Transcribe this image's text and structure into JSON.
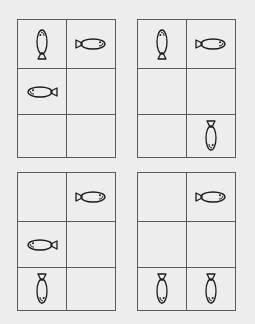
{
  "colors": {
    "background": "#ededed",
    "line": "#5a5a5a",
    "fish": "#1a1a1a"
  },
  "grid_size": {
    "rows": 3,
    "cols": 2
  },
  "panels": [
    {
      "name": "panel-top-left",
      "pos": [
        17,
        19
      ],
      "cells": [
        [
          "up",
          "right"
        ],
        [
          "left",
          ""
        ],
        [
          "",
          ""
        ]
      ]
    },
    {
      "name": "panel-top-right",
      "pos": [
        137,
        19
      ],
      "cells": [
        [
          "up",
          "right"
        ],
        [
          "",
          ""
        ],
        [
          "",
          "down"
        ]
      ]
    },
    {
      "name": "panel-bottom-left",
      "pos": [
        17,
        172
      ],
      "cells": [
        [
          "",
          "right"
        ],
        [
          "left",
          ""
        ],
        [
          "down",
          ""
        ]
      ]
    },
    {
      "name": "panel-bottom-right",
      "pos": [
        137,
        172
      ],
      "cells": [
        [
          "",
          "right"
        ],
        [
          "",
          ""
        ],
        [
          "down",
          "down"
        ]
      ]
    }
  ]
}
